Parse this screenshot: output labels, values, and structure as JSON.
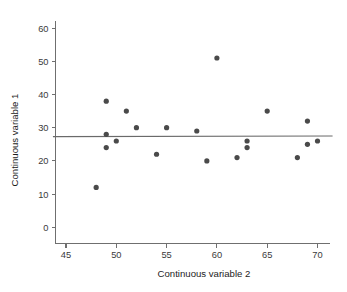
{
  "chart_data": {
    "type": "scatter",
    "title": "",
    "xlabel": "Continuous variable 2",
    "ylabel": "Continuous variable 1",
    "xlim": [
      43.7,
      71.5
    ],
    "ylim": [
      -2.5,
      63.5
    ],
    "xticks": [
      45,
      50,
      55,
      60,
      65,
      70
    ],
    "yticks": [
      0,
      10,
      20,
      30,
      40,
      50,
      60
    ],
    "xtick_labels": [
      "45",
      "50",
      "55",
      "60",
      "65",
      "70"
    ],
    "ytick_labels": [
      "0",
      "10",
      "20",
      "30",
      "40",
      "50",
      "60"
    ],
    "grid": false,
    "legend": null,
    "point_color": "#4a4a4a",
    "line_color": "#6a6a6a",
    "axis_color": "#6f6f6f",
    "background": "#ffffff",
    "x": [
      48,
      49,
      49,
      49,
      50,
      51,
      52,
      54,
      55,
      58,
      59,
      60,
      62,
      63,
      63,
      65,
      68,
      69,
      69,
      70
    ],
    "y": [
      12,
      38,
      28,
      24,
      26,
      35,
      30,
      22,
      30,
      29,
      20,
      51,
      21,
      26,
      24,
      35,
      21,
      32,
      25,
      26
    ],
    "points": [
      {
        "x": 48,
        "y": 12
      },
      {
        "x": 49,
        "y": 38
      },
      {
        "x": 49,
        "y": 28
      },
      {
        "x": 49,
        "y": 24
      },
      {
        "x": 50,
        "y": 26
      },
      {
        "x": 51,
        "y": 35
      },
      {
        "x": 52,
        "y": 30
      },
      {
        "x": 54,
        "y": 22
      },
      {
        "x": 55,
        "y": 30
      },
      {
        "x": 58,
        "y": 29
      },
      {
        "x": 59,
        "y": 20
      },
      {
        "x": 60,
        "y": 51
      },
      {
        "x": 62,
        "y": 21
      },
      {
        "x": 63,
        "y": 26
      },
      {
        "x": 63,
        "y": 24
      },
      {
        "x": 65,
        "y": 35
      },
      {
        "x": 68,
        "y": 21
      },
      {
        "x": 69,
        "y": 32
      },
      {
        "x": 69,
        "y": 25
      },
      {
        "x": 70,
        "y": 26
      }
    ],
    "fit_line": {
      "type": "linear",
      "x_start": 43.7,
      "x_end": 71.5,
      "y_start": 27.3,
      "y_end": 27.5,
      "description": "near-horizontal regression line"
    }
  }
}
